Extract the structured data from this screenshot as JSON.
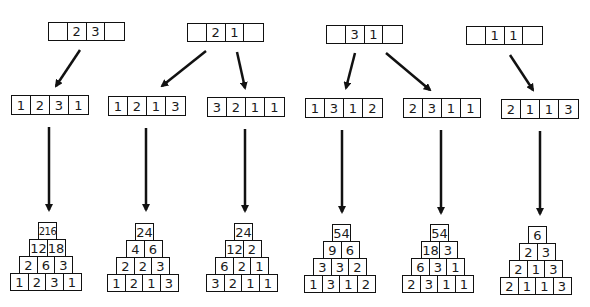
{
  "diagram": {
    "top_patterns": [
      {
        "id": "A",
        "cells": [
          "",
          "2",
          "3",
          ""
        ]
      },
      {
        "id": "B",
        "cells": [
          "",
          "2",
          "1",
          ""
        ]
      },
      {
        "id": "C",
        "cells": [
          "",
          "3",
          "1",
          ""
        ]
      },
      {
        "id": "D",
        "cells": [
          "",
          "1",
          "1",
          ""
        ]
      }
    ],
    "sequences": [
      {
        "from": "A",
        "cells": [
          "1",
          "2",
          "3",
          "1"
        ]
      },
      {
        "from": "B",
        "cells": [
          "1",
          "2",
          "1",
          "3"
        ]
      },
      {
        "from": "B",
        "cells": [
          "3",
          "2",
          "1",
          "1"
        ]
      },
      {
        "from": "C",
        "cells": [
          "1",
          "3",
          "1",
          "2"
        ]
      },
      {
        "from": "C",
        "cells": [
          "2",
          "3",
          "1",
          "1"
        ]
      },
      {
        "from": "D",
        "cells": [
          "2",
          "1",
          "1",
          "3"
        ]
      }
    ],
    "pyramids": [
      {
        "rows": [
          [
            "216"
          ],
          [
            "12",
            "18"
          ],
          [
            "2",
            "6",
            "3"
          ],
          [
            "1",
            "2",
            "3",
            "1"
          ]
        ]
      },
      {
        "rows": [
          [
            "24"
          ],
          [
            "4",
            "6"
          ],
          [
            "2",
            "2",
            "3"
          ],
          [
            "1",
            "2",
            "1",
            "3"
          ]
        ]
      },
      {
        "rows": [
          [
            "24"
          ],
          [
            "12",
            "2"
          ],
          [
            "6",
            "2",
            "1"
          ],
          [
            "3",
            "2",
            "1",
            "1"
          ]
        ]
      },
      {
        "rows": [
          [
            "54"
          ],
          [
            "9",
            "6"
          ],
          [
            "3",
            "3",
            "2"
          ],
          [
            "1",
            "3",
            "1",
            "2"
          ]
        ]
      },
      {
        "rows": [
          [
            "54"
          ],
          [
            "18",
            "3"
          ],
          [
            "6",
            "3",
            "1"
          ],
          [
            "2",
            "3",
            "1",
            "1"
          ]
        ]
      },
      {
        "rows": [
          [
            "6"
          ],
          [
            "2",
            "3"
          ],
          [
            "2",
            "1",
            "3"
          ],
          [
            "2",
            "1",
            "1",
            "3"
          ]
        ]
      }
    ]
  }
}
